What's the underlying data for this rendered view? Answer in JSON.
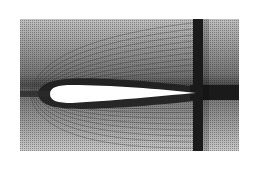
{
  "figure": {
    "title": "Structured computational mesh around an airfoil",
    "subject": "airfoil",
    "background_color": "#ffffff",
    "mesh_color": "#2a2a2a",
    "dense_band_color": "#1a1a1a",
    "airfoil_fill": "#ffffff",
    "domain": {
      "x": 20,
      "y": 19,
      "width": 219,
      "height": 132
    },
    "airfoil": {
      "leading_edge": [
        50,
        94
      ],
      "trailing_edge": [
        196,
        93
      ],
      "max_thickness_y_top": 85,
      "max_thickness_y_bottom": 103
    },
    "vertical_refinement_band": {
      "x": 193,
      "width": 10
    },
    "wake_refinement_band": {
      "y_top": 85,
      "y_bottom": 100
    },
    "regions": [
      "far-field C-grid",
      "boundary layer",
      "wake band",
      "vertical refinement band"
    ]
  }
}
